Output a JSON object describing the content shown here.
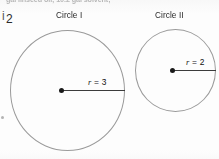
{
  "page": {
    "width": 219,
    "height": 159,
    "background_color": "#fdfdfd",
    "clipped_header_text": "gal linseed oil; 10.2 gal solvent;",
    "margin_item_number": "2",
    "margin_item_number_partial_glyph": "i"
  },
  "figures": [
    {
      "caption": "Circle I",
      "radius_label_variable": "r",
      "radius_label_equals": " = ",
      "radius_label_value": "3",
      "radius_label_full": "r = 3",
      "center_dot": "center-point",
      "stroke_color": "#9a9a9a",
      "radius_line_color": "#3c3c3c"
    },
    {
      "caption": "Circle II",
      "radius_label_variable": "r",
      "radius_label_equals": " = ",
      "radius_label_value": "2",
      "radius_label_full": "r = 2",
      "center_dot": "center-point",
      "stroke_color": "#9a9a9a",
      "radius_line_color": "#3c3c3c"
    }
  ],
  "chart_data": {
    "type": "diagram",
    "title": "",
    "shapes": [
      {
        "name": "Circle I",
        "shape": "circle",
        "radius_value": 3,
        "radius_units": "",
        "label": "r = 3",
        "pixel_center": [
          61,
          90
        ],
        "pixel_radius_x": 57,
        "pixel_radius_y": 60
      },
      {
        "name": "Circle II",
        "shape": "circle",
        "radius_value": 2,
        "radius_units": "",
        "label": "r = 2",
        "pixel_center": [
          172,
          70
        ],
        "pixel_radius_x": 40,
        "pixel_radius_y": 41
      }
    ],
    "ratio_radii": "3 : 2",
    "legend": [],
    "grid": false
  }
}
